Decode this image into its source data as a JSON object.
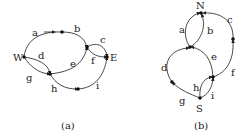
{
  "diagrams": [
    {
      "caption": "(a)",
      "source_label": "W",
      "sink_label": "E",
      "edges": [
        {
          "label": "a",
          "from": "W",
          "to": "n1"
        },
        {
          "label": "b",
          "from": "n1",
          "to": "n2"
        },
        {
          "label": "c",
          "from": "n2",
          "to": "E"
        },
        {
          "label": "d",
          "from": "W",
          "to": "n3"
        },
        {
          "label": "e",
          "from": "n3",
          "to": "n2"
        },
        {
          "label": "f",
          "from": "n2",
          "to": "E"
        },
        {
          "label": "g",
          "from": "W",
          "to": "n3"
        },
        {
          "label": "h",
          "from": "n3",
          "to": "n4"
        },
        {
          "label": "i",
          "from": "n4",
          "to": "E"
        }
      ]
    },
    {
      "caption": "(b)",
      "source_label": "S",
      "sink_label": "N",
      "edges": [
        {
          "label": "a",
          "from": "m1",
          "to": "N"
        },
        {
          "label": "b",
          "from": "m1",
          "to": "N"
        },
        {
          "label": "c",
          "from": "m2",
          "to": "N"
        },
        {
          "label": "d",
          "from": "m3",
          "to": "m1"
        },
        {
          "label": "e",
          "from": "m4",
          "to": "m1"
        },
        {
          "label": "f",
          "from": "m4",
          "to": "m2"
        },
        {
          "label": "g",
          "from": "S",
          "to": "m3"
        },
        {
          "label": "h",
          "from": "S",
          "to": "m4"
        },
        {
          "label": "i",
          "from": "S",
          "to": "m4"
        }
      ]
    }
  ]
}
